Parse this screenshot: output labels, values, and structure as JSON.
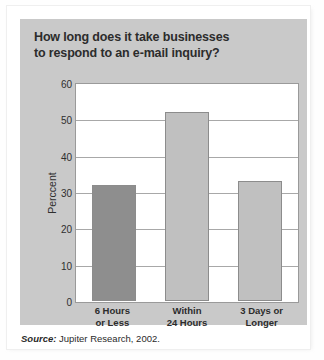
{
  "figure": {
    "title_line1": "How long does it take businesses",
    "title_line2": "to respond to an e-mail inquiry?",
    "source_label": "Source:",
    "source_text": " Jupiter Research, 2002.",
    "panel_color": "#c9c9c9",
    "plot_background": "#ffffff",
    "title_color": "#2c2c2c"
  },
  "chart_data": {
    "type": "bar",
    "title": "How long does it take businesses to respond to an e-mail inquiry?",
    "categories": [
      "6 Hours or Less",
      "Within 24 Hours",
      "3 Days or Longer"
    ],
    "category_lines": [
      [
        "6 Hours",
        "or Less"
      ],
      [
        "Within",
        "24 Hours"
      ],
      [
        "3 Days or",
        "Longer"
      ]
    ],
    "values": [
      32,
      52,
      33
    ],
    "bar_colors": [
      "#8e8e8e",
      "#c0c0c0",
      "#c0c0c0"
    ],
    "xlabel": "",
    "ylabel": "Perccent",
    "ylim": [
      0,
      60
    ],
    "ytick_values": [
      0,
      10,
      20,
      30,
      40,
      50,
      60
    ],
    "ytick_labels": [
      "0",
      "10",
      "20",
      "30",
      "40",
      "50",
      "60"
    ],
    "grid": true,
    "legend": false,
    "source": "Source: Jupiter Research, 2002."
  }
}
